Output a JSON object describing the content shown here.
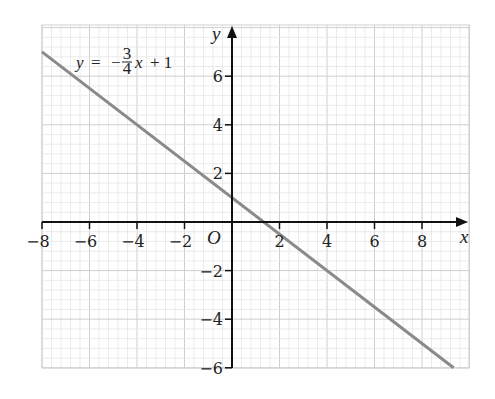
{
  "chart_data": {
    "type": "line",
    "title": "",
    "annotation": "y = -3/4 x + 1",
    "equation": {
      "y": "y",
      "equals": "=",
      "minus": "−",
      "num": "3",
      "den": "4",
      "x": "x",
      "plus": "+ 1"
    },
    "xlabel": "x",
    "ylabel": "y",
    "origin_label": "O",
    "xlim": [
      -8,
      9.9
    ],
    "ylim": [
      -6,
      7
    ],
    "x_ticks": [
      -8,
      -6,
      -4,
      -2,
      2,
      4,
      6,
      8
    ],
    "x_tick_labels": [
      "−8",
      "−6",
      "−4",
      "−2",
      "2",
      "4",
      "6",
      "8"
    ],
    "y_ticks": [
      -6,
      -4,
      -2,
      2,
      4,
      6
    ],
    "y_tick_labels": [
      "−6",
      "−4",
      "−2",
      "2",
      "4",
      "6"
    ],
    "grid": true,
    "series": [
      {
        "name": "y = -3/4 x + 1",
        "x": [
          -8,
          9.33
        ],
        "y": [
          7,
          -6
        ],
        "slope": -0.75,
        "intercept": 1,
        "color": "#8a8a8a"
      }
    ]
  },
  "colors": {
    "grid_minor": "#e6e6e6",
    "grid_major": "#cfcfcf",
    "axis": "#111111",
    "line": "#8a8a8a"
  }
}
